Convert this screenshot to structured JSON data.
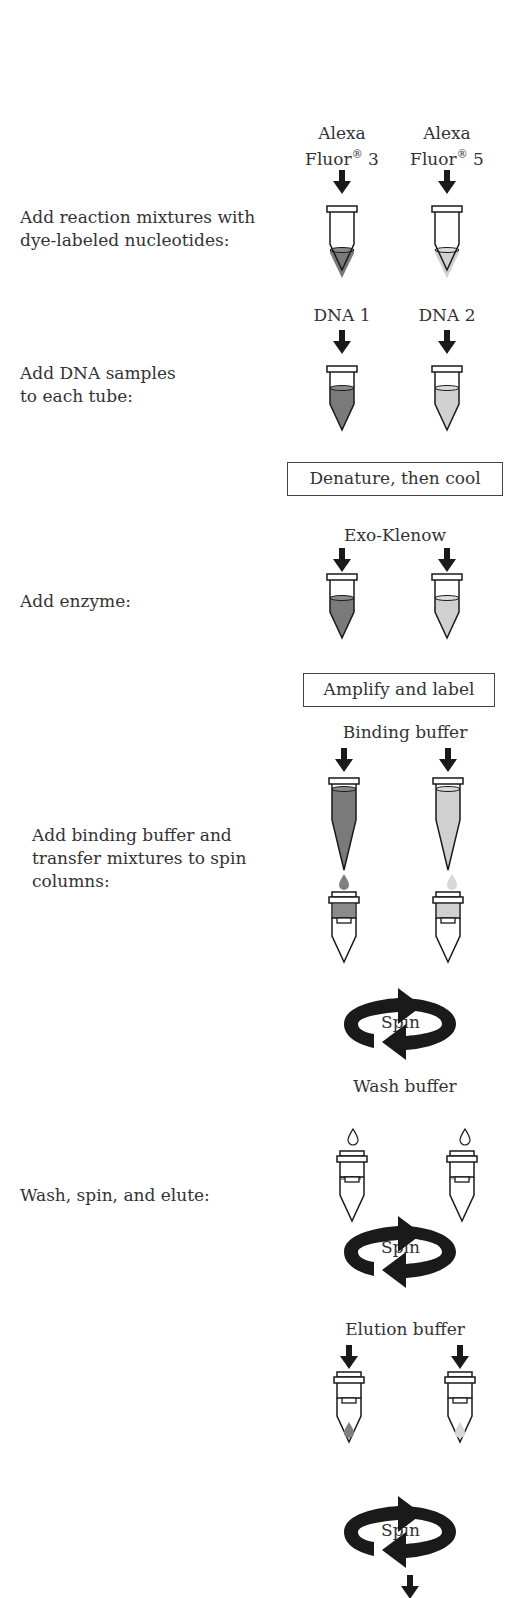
{
  "steps": {
    "s1": {
      "line1": "Add reaction mixtures with",
      "line2": "dye-labeled nucleotides:"
    },
    "s2": {
      "line1": "Add DNA samples",
      "line2": "to each tube:"
    },
    "s3": {
      "line1": "Add enzyme:"
    },
    "s4": {
      "line1": "Add binding buffer and",
      "line2": "transfer mixtures to spin",
      "line3": "columns:"
    },
    "s5": {
      "line1": "Wash, spin, and elute:"
    }
  },
  "reagents": {
    "dye1_line1": "Alexa",
    "dye1_line2": "Fluor",
    "dye1_num": " 3",
    "dye2_line1": "Alexa",
    "dye2_line2": "Fluor",
    "dye2_num": " 5",
    "reg_mark": "®",
    "dna1": "DNA 1",
    "dna2": "DNA 2",
    "enzyme": "Exo-Klenow",
    "binding": "Binding buffer",
    "wash": "Wash buffer",
    "elution": "Elution buffer"
  },
  "boxes": {
    "denature": "Denature, then cool",
    "amplify": "Amplify and label"
  },
  "spin": {
    "label": "Spin"
  },
  "colors": {
    "dye1": "#7a7a7a",
    "dye2": "#cfcfcf",
    "ink": "#1a1a1a"
  }
}
